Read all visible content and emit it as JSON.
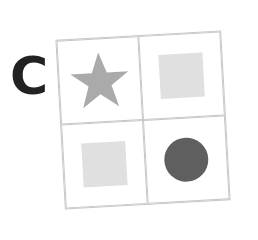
{
  "label": "C",
  "grid": {
    "rows": 2,
    "cols": 2,
    "border_color": "#c8c8c8",
    "cells": [
      {
        "position": "top-left",
        "shape": "star",
        "color": "#aaaaaa"
      },
      {
        "position": "top-right",
        "shape": "square",
        "color": "#e0e0e0"
      },
      {
        "position": "bottom-left",
        "shape": "square",
        "color": "#e0e0e0"
      },
      {
        "position": "bottom-right",
        "shape": "circle",
        "color": "#5f5f5f"
      }
    ]
  }
}
